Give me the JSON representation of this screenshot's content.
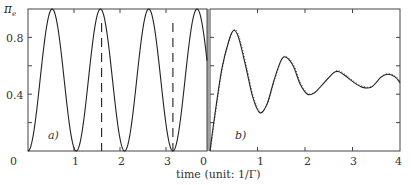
{
  "chart_data": [
    {
      "panel": "a)",
      "type": "line",
      "title": "",
      "xlabel": "time (unit: 1/Γ)",
      "ylabel": "π_e",
      "xlim": [
        0,
        3.1
      ],
      "ylim": [
        0,
        1.0
      ],
      "x_ticks": [
        "0",
        "1",
        "2",
        "3"
      ],
      "y_ticks": [
        "0",
        "0.4",
        "0.8"
      ],
      "grid": false,
      "series": [
        {
          "name": "Rabi oscillation",
          "style": "solid",
          "description": "sin^2 oscillation, period ~1.05, minima at ~0, 1.05, 2.1, 3.15; maxima = 1.0 at ~0.52, 1.57, 2.62"
        },
        {
          "name": "markers",
          "style": "dashed",
          "x": [
            1.6,
            3.15
          ],
          "description": "vertical dashed lines"
        }
      ]
    },
    {
      "panel": "b)",
      "type": "line",
      "title": "",
      "xlabel": "time (unit: 1/Γ)",
      "ylabel": "",
      "xlim": [
        0,
        4
      ],
      "ylim": [
        0,
        1.0
      ],
      "x_ticks": [
        "0",
        "1",
        "2",
        "3",
        "4"
      ],
      "y_ticks": [],
      "grid": false,
      "series": [
        {
          "name": "damped Rabi oscillation",
          "style": "solid",
          "x": [
            0,
            0.1,
            0.25,
            0.4,
            0.5,
            0.6,
            0.75,
            0.9,
            1.05,
            1.2,
            1.35,
            1.5,
            1.6,
            1.75,
            1.9,
            2.05,
            2.2,
            2.4,
            2.6,
            2.7,
            2.85,
            3.0,
            3.2,
            3.4,
            3.6,
            3.75,
            3.9,
            4.0
          ],
          "y": [
            0.0,
            0.25,
            0.58,
            0.78,
            0.85,
            0.8,
            0.6,
            0.38,
            0.27,
            0.33,
            0.5,
            0.64,
            0.66,
            0.6,
            0.47,
            0.4,
            0.41,
            0.48,
            0.55,
            0.56,
            0.53,
            0.49,
            0.45,
            0.45,
            0.52,
            0.54,
            0.52,
            0.48
          ]
        }
      ]
    }
  ],
  "labels": {
    "y_axis_symbol": "π",
    "y_axis_sub": "e",
    "y_tick_08": "0.8",
    "y_tick_04": "0.4",
    "y_tick_0": "0",
    "panel_a": "a)",
    "panel_b": "b)",
    "a_x_ticks": [
      "1",
      "2",
      "3"
    ],
    "b_x_ticks": [
      "0",
      "1",
      "2",
      "3",
      "4"
    ],
    "x_axis_title": "time (unit: 1/Γ)"
  }
}
